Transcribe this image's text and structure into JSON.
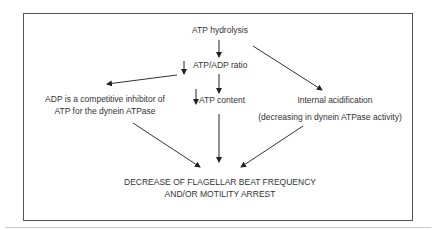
{
  "nodes": {
    "atp_hydrolysis": "ATP hydrolysis",
    "atp_adp_ratio": "ATP/ADP ratio",
    "atp_content": "ATP content",
    "adp_inhibitor_line1": "ADP is a competitive inhibitor of",
    "adp_inhibitor_line2": "ATP for the dynein ATPase",
    "internal_acidification": "Internal acidification",
    "dynein_activity_note": "(decreasing in dynein ATPase activity)",
    "outcome_line1": "DECREASE OF FLAGELLAR BEAT FREQUENCY",
    "outcome_line2": "AND/OR MOTILITY ARREST"
  },
  "indicators": {
    "decrease_symbol": "↓"
  },
  "edges": [
    {
      "from": "ATP hydrolysis",
      "to": "ATP/ADP ratio"
    },
    {
      "from": "ATP hydrolysis",
      "to": "Internal acidification"
    },
    {
      "from": "ATP/ADP ratio",
      "to": "ATP content"
    },
    {
      "from": "ATP/ADP ratio",
      "to": "ADP is a competitive inhibitor of ATP for the dynein ATPase"
    },
    {
      "from": "ATP content",
      "to": "DECREASE OF FLAGELLAR BEAT FREQUENCY AND/OR MOTILITY ARREST"
    },
    {
      "from": "ADP is a competitive inhibitor of ATP for the dynein ATPase",
      "to": "DECREASE OF FLAGELLAR BEAT FREQUENCY AND/OR MOTILITY ARREST"
    },
    {
      "from": "(decreasing in dynein ATPase activity)",
      "to": "DECREASE OF FLAGELLAR BEAT FREQUENCY AND/OR MOTILITY ARREST"
    }
  ]
}
